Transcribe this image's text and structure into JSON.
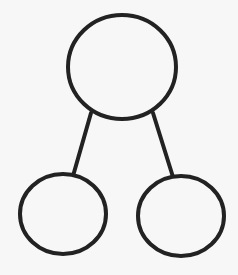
{
  "diagram": {
    "type": "tree",
    "background_color": "#f7f7f7",
    "stroke_color": "#222222",
    "stroke_width": 4,
    "nodes": [
      {
        "id": "root",
        "label": "",
        "cx": 122,
        "cy": 67,
        "rx": 54,
        "ry": 52
      },
      {
        "id": "left-child",
        "label": "",
        "cx": 63,
        "cy": 214,
        "rx": 43,
        "ry": 40
      },
      {
        "id": "right-child",
        "label": "",
        "cx": 181,
        "cy": 216,
        "rx": 43,
        "ry": 40
      }
    ],
    "edges": [
      {
        "from": "root",
        "to": "left-child",
        "x1": 91,
        "y1": 113,
        "x2": 73,
        "y2": 176
      },
      {
        "from": "root",
        "to": "right-child",
        "x1": 153,
        "y1": 113,
        "x2": 173,
        "y2": 177
      }
    ]
  }
}
